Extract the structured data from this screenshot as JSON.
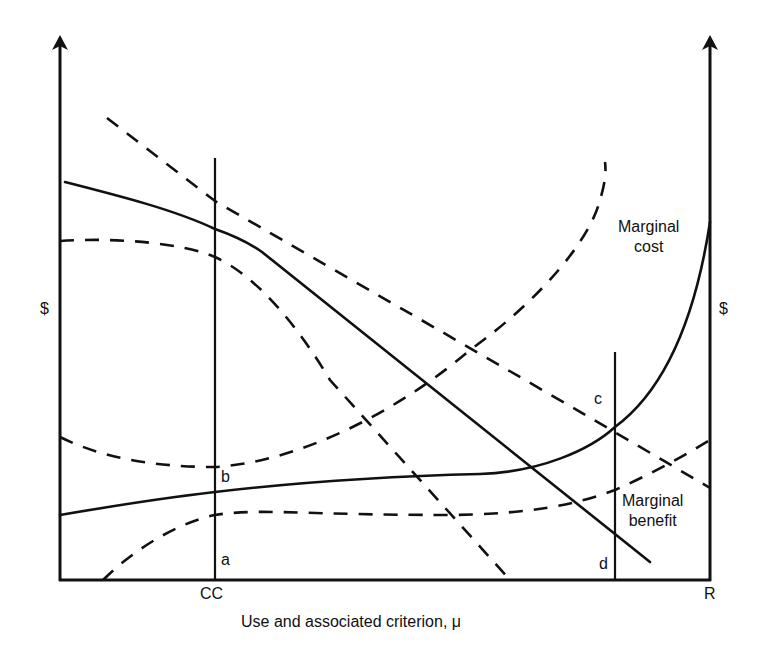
{
  "diagram": {
    "type": "economics-marginal-analysis",
    "axes": {
      "left_y_label": "$",
      "right_y_label": "$",
      "x_title": "Use and associated criterion, μ",
      "x_tick_left": "CC",
      "x_tick_right": "R"
    },
    "points": {
      "a": "a",
      "b": "b",
      "c": "c",
      "d": "d"
    },
    "curves": {
      "marginal_cost": {
        "label_line1": "Marginal",
        "label_line2": "cost",
        "style": "solid"
      },
      "marginal_benefit": {
        "label_line1": "Marginal",
        "label_line2": "benefit",
        "style": "solid"
      },
      "marginal_cost_upper_bound": {
        "style": "dashed"
      },
      "marginal_cost_lower_bound": {
        "style": "dashed"
      },
      "marginal_benefit_upper_bound": {
        "style": "dashed"
      },
      "marginal_benefit_lower_bound": {
        "style": "dashed"
      }
    },
    "colors": {
      "line": "#111111",
      "background": "#ffffff"
    }
  }
}
